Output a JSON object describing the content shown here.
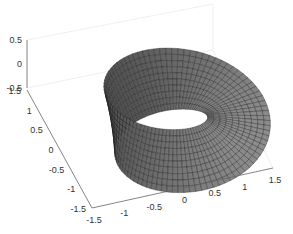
{
  "chart_data": {
    "type": "surface3d",
    "title": "",
    "xlabel": "",
    "ylabel": "",
    "zlabel": "",
    "x_ticks": [
      "-1.5",
      "-1",
      "-0.5",
      "0",
      "0.5",
      "1",
      "1.5"
    ],
    "y_ticks": [
      "-1.5",
      "-1",
      "-0.5",
      "0",
      "0.5",
      "1",
      "1.5"
    ],
    "z_ticks": [
      "-0.5",
      "0",
      "0.5"
    ],
    "xlim": [
      -1.5,
      1.5
    ],
    "ylim": [
      -1.5,
      1.5
    ],
    "zlim": [
      -0.5,
      0.5
    ],
    "grid": true,
    "colormap": "gray",
    "surface": {
      "shape": "mobius",
      "radius": 1,
      "half_width": 0.5
    }
  },
  "colors": {
    "surface_dark": "#2a2a2a",
    "surface_light": "#8a8a8a",
    "axis": "#555555",
    "grid": "#e6e6e6"
  }
}
